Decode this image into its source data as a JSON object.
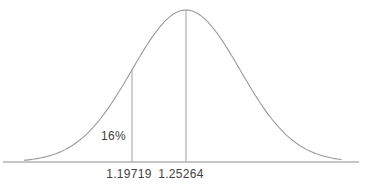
{
  "colors": {
    "background": "#ffffff",
    "curve_stroke": "#9a9a9a",
    "baseline_stroke": "#8d8d8d",
    "marker_line_stroke": "#a8a8a8",
    "label_text": "#424242"
  },
  "chart_data": {
    "type": "line",
    "curve_kind": "normal-distribution-bell-curve",
    "title": "",
    "xlabel": "",
    "ylabel": "",
    "grid": false,
    "legend": false,
    "y_axis_shown": false,
    "mean": 1.25264,
    "one_sd_below": 1.19719,
    "sigma": 0.05545,
    "left_tail_area_percent": 16,
    "x_ticks": [
      1.19719,
      1.25264
    ],
    "annotations": {
      "area_label": "16%",
      "tick_sd_below_label": "1.19719",
      "tick_mean_label": "1.25264"
    },
    "marked_lines": [
      {
        "value": 1.19719,
        "from": "curve",
        "to": "baseline"
      },
      {
        "value": 1.25264,
        "from": "peak",
        "to": "baseline"
      }
    ]
  }
}
